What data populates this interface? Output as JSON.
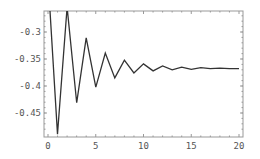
{
  "chart_data": {
    "type": "line",
    "title": "",
    "xlabel": "",
    "ylabel": "",
    "xlim": [
      0,
      20
    ],
    "ylim": [
      -0.49,
      -0.26
    ],
    "grid": false,
    "legend": null,
    "x_ticks": [
      0,
      5,
      10,
      15,
      20
    ],
    "x_tick_labels": [
      "0",
      "5",
      "10",
      "15",
      "20"
    ],
    "y_ticks": [
      -0.3,
      -0.35,
      -0.4,
      -0.45
    ],
    "y_tick_labels": [
      "-0.3",
      "-0.35",
      "-0.4",
      "-0.45"
    ],
    "series": [
      {
        "name": "sequence",
        "x": [
          0,
          1,
          2,
          3,
          4,
          5,
          6,
          7,
          8,
          9,
          10,
          11,
          12,
          13,
          14,
          15,
          16,
          17,
          18,
          19,
          20
        ],
        "values": [
          -0.2,
          -0.489,
          -0.254,
          -0.431,
          -0.311,
          -0.402,
          -0.339,
          -0.385,
          -0.352,
          -0.376,
          -0.359,
          -0.372,
          -0.363,
          -0.37,
          -0.365,
          -0.369,
          -0.366,
          -0.368,
          -0.367,
          -0.368,
          -0.368
        ]
      }
    ]
  }
}
